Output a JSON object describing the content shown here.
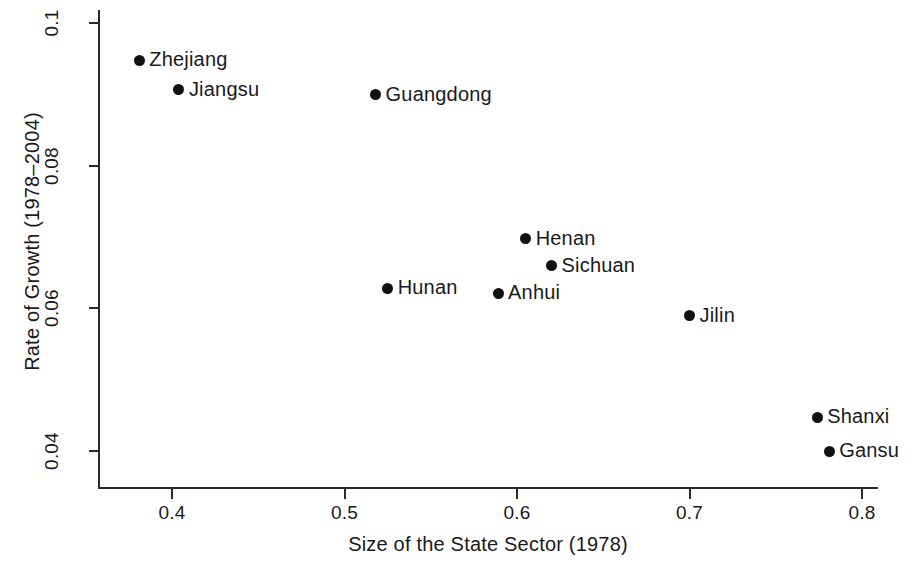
{
  "chart_data": {
    "type": "scatter",
    "title": "",
    "xlabel": "Size of the State Sector (1978)",
    "ylabel": "Rate of Growth (1978–2004)",
    "xlim": [
      0.355,
      0.81
    ],
    "ylim": [
      0.0345,
      0.1015
    ],
    "xticks": [
      "0.4",
      "0.5",
      "0.6",
      "0.7",
      "0.8"
    ],
    "xtick_values": [
      0.4,
      0.5,
      0.6,
      0.7,
      0.8
    ],
    "yticks": [
      "0.04",
      "0.06",
      "0.08",
      "0.1"
    ],
    "ytick_values": [
      0.04,
      0.06,
      0.08,
      0.1
    ],
    "grid": false,
    "legend": "none",
    "marker_color": "#111111",
    "axis_color": "#2a2a2a",
    "points": [
      {
        "label": "Zhejiang",
        "x": 0.381,
        "y": 0.0948,
        "label_side": "right"
      },
      {
        "label": "Jiangsu",
        "x": 0.404,
        "y": 0.0906,
        "label_side": "right"
      },
      {
        "label": "Guangdong",
        "x": 0.518,
        "y": 0.0899,
        "label_side": "right"
      },
      {
        "label": "Henan",
        "x": 0.605,
        "y": 0.0697,
        "label_side": "right"
      },
      {
        "label": "Sichuan",
        "x": 0.62,
        "y": 0.0659,
        "label_side": "right"
      },
      {
        "label": "Hunan",
        "x": 0.525,
        "y": 0.0628,
        "label_side": "right"
      },
      {
        "label": "Anhui",
        "x": 0.589,
        "y": 0.0621,
        "label_side": "right"
      },
      {
        "label": "Jilin",
        "x": 0.7,
        "y": 0.0589,
        "label_side": "right"
      },
      {
        "label": "Shanxi",
        "x": 0.774,
        "y": 0.0447,
        "label_side": "right"
      },
      {
        "label": "Gansu",
        "x": 0.781,
        "y": 0.0399,
        "label_side": "right"
      }
    ]
  }
}
